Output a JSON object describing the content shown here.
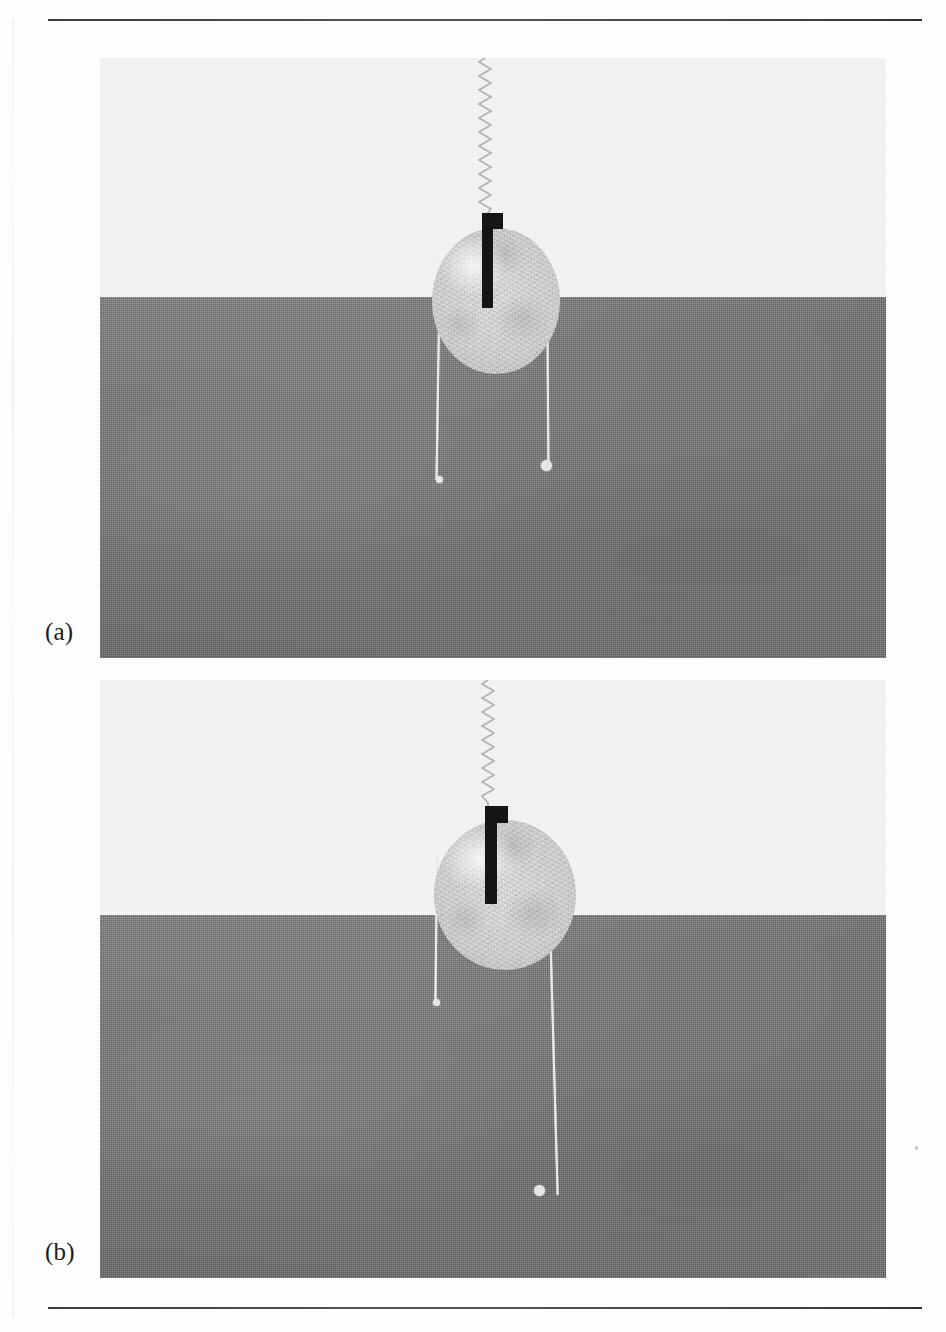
{
  "figure": {
    "kind": "two-panel photographic figure",
    "background_color": "#fdfdfd",
    "rules": {
      "top": {
        "label": "top-rule",
        "color": "#3f3f3f"
      },
      "bottom": {
        "label": "bottom-rule",
        "color": "#3f3f3f"
      }
    },
    "captions": [
      {
        "id": "a",
        "text": "(a)"
      },
      {
        "id": "b",
        "text": "(b)"
      }
    ]
  },
  "panels": [
    {
      "id": "a",
      "caption": "(a)",
      "sky_color": "#f3f3f3",
      "ground_color": "#787878",
      "horizon_fraction": 0.398,
      "objects": {
        "coil": {
          "name": "coil-spring",
          "turns": 22,
          "color": "#b9b9b9"
        },
        "disc": {
          "name": "fibre-disc",
          "color": "#dcdcdc"
        },
        "flag": {
          "name": "black-flag-marker",
          "color": "#151515"
        },
        "threads": [
          {
            "name": "thread-left",
            "has_bead": true
          },
          {
            "name": "thread-right",
            "has_bead": true
          }
        ]
      }
    },
    {
      "id": "b",
      "caption": "(b)",
      "sky_color": "#f3f3f3",
      "ground_color": "#787878",
      "horizon_fraction": 0.393,
      "objects": {
        "coil": {
          "name": "coil-spring",
          "turns": 16,
          "color": "#b9b9b9"
        },
        "disc": {
          "name": "fibre-disc",
          "color": "#dcdcdc"
        },
        "flag": {
          "name": "black-flag-marker",
          "color": "#151515"
        },
        "threads": [
          {
            "name": "thread-left",
            "has_bead": true
          },
          {
            "name": "thread-right",
            "has_bead": true
          }
        ]
      }
    }
  ],
  "colors": {
    "page": "#fdfdfd",
    "sky": "#f3f3f3",
    "ground": "#787878",
    "disc": "#dcdcdc",
    "flag": "#151515",
    "thread": "#eaeaea",
    "rule": "#3f3f3f",
    "caption_text": "#1c1c1c"
  }
}
